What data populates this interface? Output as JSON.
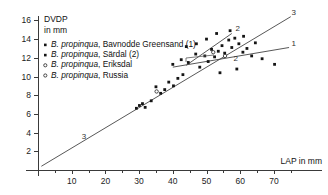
{
  "chart_data": {
    "type": "scatter",
    "title": "",
    "ylabel_line1": "DVDP",
    "ylabel_line2": "in mm",
    "xlabel": "LAP in mm",
    "xlim": [
      0,
      76
    ],
    "ylim": [
      0,
      17
    ],
    "xticks": [
      10,
      20,
      30,
      40,
      50,
      60,
      70
    ],
    "yticks": [
      2,
      4,
      6,
      8,
      10,
      12,
      14,
      16
    ],
    "xtick_labels": [
      "10",
      "20",
      "30",
      "40",
      "50",
      "60",
      "70"
    ],
    "ytick_labels": [
      "2",
      "4",
      "6",
      "8",
      "10",
      "12",
      "14",
      "16"
    ],
    "grid": false,
    "legend_position": "top-left",
    "legend": [
      {
        "marker": "filled",
        "genus": "B. propinqua",
        "locality": "Bavnodde Greensand (1)"
      },
      {
        "marker": "filled",
        "genus": "B. propinqua",
        "locality": "Särdal (2)"
      },
      {
        "marker": "open",
        "genus": "B. propinqua",
        "locality": "Eriksdal"
      },
      {
        "marker": "open",
        "genus": "B. propinqua",
        "locality": "Russia"
      }
    ],
    "series": [
      {
        "name": "B. propinqua, Bavnodde Greensand (1)",
        "marker": "filled",
        "points": [
          [
            40.0,
            11.3
          ],
          [
            42.5,
            11.8
          ],
          [
            44.6,
            11.5
          ],
          [
            46.8,
            12.4
          ],
          [
            48.0,
            11.0
          ],
          [
            49.5,
            12.2
          ],
          [
            50.5,
            11.6
          ],
          [
            51.5,
            12.9
          ],
          [
            52.4,
            12.1
          ],
          [
            53.5,
            12.7
          ],
          [
            54.6,
            13.3
          ],
          [
            55.4,
            12.5
          ],
          [
            56.6,
            13.9
          ],
          [
            57.5,
            13.1
          ],
          [
            58.4,
            14.1
          ],
          [
            59.6,
            13.5
          ],
          [
            60.8,
            12.6
          ],
          [
            62.0,
            13.0
          ],
          [
            63.4,
            12.2
          ],
          [
            66.5,
            11.9
          ],
          [
            70.2,
            11.3
          ],
          [
            57.0,
            14.9
          ],
          [
            61.0,
            14.3
          ],
          [
            64.5,
            13.6
          ],
          [
            47.0,
            13.5
          ],
          [
            50.0,
            14.0
          ],
          [
            53.0,
            14.6
          ],
          [
            44.0,
            13.2
          ],
          [
            59.0,
            10.8
          ],
          [
            54.0,
            10.4
          ]
        ]
      },
      {
        "name": "B. propinqua, Särdal (2)",
        "marker": "filled",
        "points": [
          [
            29.2,
            6.6
          ],
          [
            30.1,
            6.9
          ],
          [
            31.0,
            7.1
          ],
          [
            31.8,
            6.7
          ],
          [
            33.6,
            7.4
          ],
          [
            35.0,
            8.9
          ],
          [
            36.4,
            8.2
          ],
          [
            37.6,
            8.6
          ],
          [
            38.8,
            9.4
          ],
          [
            40.2,
            9.0
          ],
          [
            41.5,
            9.8
          ],
          [
            43.0,
            10.2
          ]
        ]
      },
      {
        "name": "B. propinqua, Eriksdal",
        "marker": "open",
        "points": [
          [
            55.5,
            12.2
          ],
          [
            35.2,
            8.4
          ]
        ]
      },
      {
        "name": "B. propinqua, Russia",
        "marker": "open",
        "points": [
          [
            52.0,
            12.6
          ]
        ]
      }
    ],
    "regression_lines": [
      {
        "id": "1",
        "label": "1",
        "label_position": "right",
        "x1": 40.0,
        "y1": 11.0,
        "x2": 74.5,
        "y2": 13.1
      },
      {
        "id": "2",
        "label": "2",
        "label_position": "upper-middle",
        "x1": 44.0,
        "y1": 11.2,
        "x2": 57.5,
        "y2": 14.6
      },
      {
        "id": "3",
        "label": "3",
        "label_position": "both-ends",
        "x1": 1.0,
        "y1": 0.4,
        "x2": 75.0,
        "y2": 16.4
      }
    ],
    "annotations": [
      {
        "text": "3",
        "x": 13.0,
        "y": 3.3
      },
      {
        "text": "3",
        "x": 75.2,
        "y": 16.6
      },
      {
        "text": "1",
        "x": 75.2,
        "y": 13.3
      },
      {
        "text": "2",
        "x": 58.6,
        "y": 14.9
      },
      {
        "text": "2",
        "x": 58.0,
        "y": 11.7
      }
    ]
  }
}
